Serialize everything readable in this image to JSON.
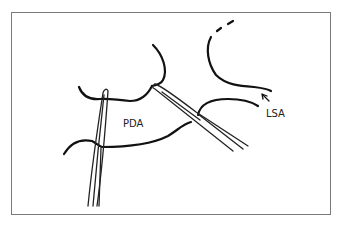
{
  "figure": {
    "labels": {
      "pda": "PDA",
      "lsa": "LSA"
    },
    "colors": {
      "line": "#111111",
      "frame": "#7a7a7a",
      "background": "#ffffff"
    }
  }
}
